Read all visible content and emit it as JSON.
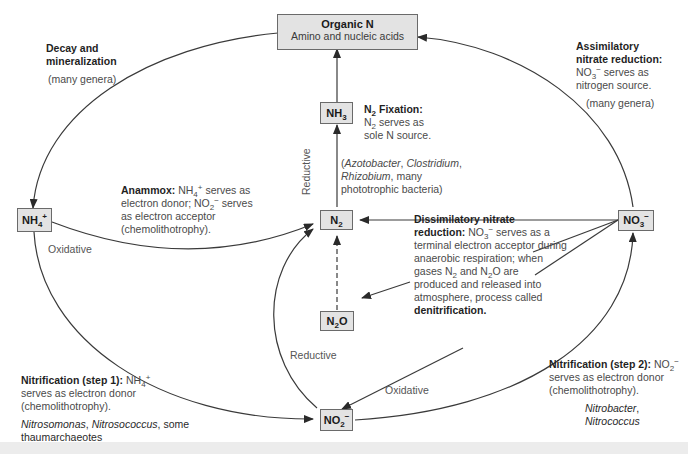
{
  "nodes": {
    "organic_n": {
      "title": "Organic N",
      "subtitle": "Amino and nucleic acids"
    },
    "nh3": {
      "base": "NH",
      "sub": "3",
      "sup": ""
    },
    "nh4": {
      "base": "NH",
      "sub": "4",
      "sup": "+"
    },
    "n2": {
      "base": "N",
      "sub": "2",
      "sup": ""
    },
    "n2o": {
      "base": "N",
      "sub": "2",
      "after": "O"
    },
    "no3": {
      "base": "NO",
      "sub": "3",
      "sup": "−"
    },
    "no2": {
      "base": "NO",
      "sub": "2",
      "sup": "−"
    }
  },
  "annotations": {
    "decay": {
      "title_line1": "Decay and",
      "title_line2": "mineralization",
      "genera": "(many genera)"
    },
    "assimilatory": {
      "title_line1": "Assimilatory",
      "title_line2": "nitrate reduction:",
      "line3_base": "NO",
      "line3_sub": "3",
      "line3_sup": "−",
      "line3_rest": " serves as",
      "line4": "nitrogen source.",
      "genera": "(many genera)"
    },
    "fixation": {
      "title_base": "N",
      "title_sub": "2",
      "title_rest": " Fixation:",
      "line2_base": "N",
      "line2_sub": "2",
      "line2_rest": " serves as",
      "line3": "sole N source.",
      "org1": "Azotobacter",
      "sep1": ", ",
      "org2": "Clostridium",
      "sep2": ",",
      "org3": "Rhizobium",
      "org3_rest": ", many",
      "org4": "phototrophic bacteria)",
      "open_paren": "("
    },
    "anammox": {
      "title": "Anammox:",
      "l1_base": " NH",
      "l1_sub": "4",
      "l1_sup": "+",
      "l1_rest": " serves as",
      "l2_a": "electron donor; NO",
      "l2_sub": "2",
      "l2_sup": "−",
      "l2_rest": " serves",
      "l3": "as electron acceptor",
      "l4": "(chemolithotrophy)."
    },
    "dissimilatory": {
      "title1": "Dissimilatory nitrate",
      "title2": "reduction:",
      "l2_base": " NO",
      "l2_sub": "3",
      "l2_sup": "−",
      "l2_rest": " serves as a",
      "l3": "terminal electron acceptor during",
      "l4": "anaerobic respiration; when",
      "l5_a": "gases N",
      "l5_sub1": "2",
      "l5_b": " and N",
      "l5_sub2": "2",
      "l5_c": "O are",
      "l6": "produced and released into",
      "l7": "atmosphere, process called",
      "l8": "denitrification."
    },
    "nitrification1": {
      "title": "Nitrification (step 1):",
      "l1_base": " NH",
      "l1_sub": "4",
      "l1_sup": "+",
      "l2": "serves as electron donor",
      "l3": "(chemolithotrophy).",
      "org1": "Nitrosomonas",
      "sep": ", ",
      "org2": "Nitrosococcus",
      "rest": ", some",
      "l_last": "thaumarchaeotes"
    },
    "nitrification2": {
      "title": "Nitrification (step 2):",
      "l1_base": " NO",
      "l1_sub": "2",
      "l1_sup": "−",
      "l2": "serves as electron donor",
      "l3": "(chemolithotrophy).",
      "org1": "Nitrobacter",
      "org1_rest": ",",
      "org2": "Nitrococcus"
    }
  },
  "edge_labels": {
    "reductive_vertical": "Reductive",
    "oxidative_left": "Oxidative",
    "reductive_bottom": "Reductive",
    "oxidative_bottom": "Oxidative"
  },
  "colors": {
    "node_fill": "#e3e3e3",
    "node_border": "#6a6a6a",
    "line": "#3a3a3a",
    "text": "#4a4a4a"
  }
}
